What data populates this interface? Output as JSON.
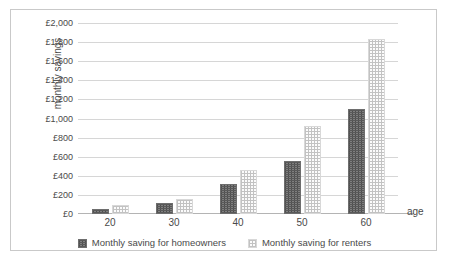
{
  "chart_data": {
    "type": "bar",
    "title": "",
    "xlabel": "age",
    "ylabel": "monthly savings",
    "categories": [
      "20",
      "30",
      "40",
      "50",
      "60"
    ],
    "ylim": [
      0,
      2000
    ],
    "ytick_labels": [
      "£2,000",
      "£1,800",
      "£1,600",
      "£1,400",
      "£1,200",
      "£1,000",
      "£800",
      "£600",
      "£400",
      "£200",
      "£0"
    ],
    "ytick_values": [
      2000,
      1800,
      1600,
      1400,
      1200,
      1000,
      800,
      600,
      400,
      200,
      0
    ],
    "grid": true,
    "legend_position": "bottom",
    "series": [
      {
        "name": "Monthly saving for homeowners",
        "color": "#7f7f7f",
        "pattern": "cross-hatch",
        "values": [
          55,
          120,
          310,
          560,
          1100
        ]
      },
      {
        "name": "Monthly saving for renters",
        "color": "#e8e8e8",
        "pattern": "dotted",
        "values": [
          90,
          155,
          465,
          920,
          1830
        ]
      }
    ]
  }
}
